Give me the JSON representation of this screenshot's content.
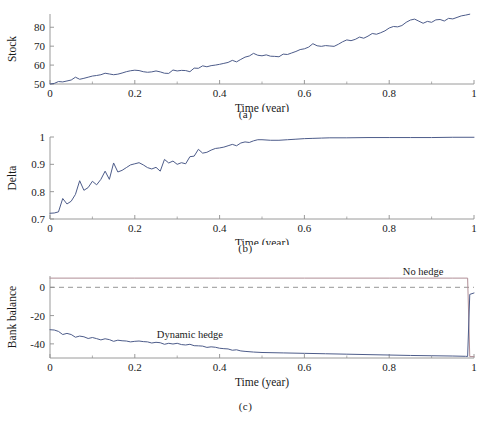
{
  "figure": {
    "panels": [
      {
        "id": "a",
        "caption": "(a)",
        "ylabel": "Stock",
        "xlabel": "Time (year)"
      },
      {
        "id": "b",
        "caption": "(b)",
        "ylabel": "Delta",
        "xlabel": "Time (year)"
      },
      {
        "id": "c",
        "caption": "(c)",
        "ylabel": "Bank balance",
        "xlabel": "Time (year)"
      }
    ]
  },
  "colors": {
    "line_primary": "#4d5c8a",
    "line_nohedge": "#b08d95",
    "zero_dashed": "#8a8a8a",
    "axis": "#8f8f8f",
    "text": "#1a1a1a",
    "background": "#ffffff"
  },
  "chart_data": [
    {
      "type": "line",
      "panel": "a",
      "title": "",
      "xlabel": "Time (year)",
      "ylabel": "Stock",
      "xlim": [
        0,
        1
      ],
      "ylim": [
        50,
        87
      ],
      "xticks": [
        0,
        0.2,
        0.4,
        0.6,
        0.8,
        1
      ],
      "xticklabels": [
        "0",
        "0.2",
        "0.4",
        "0.6",
        "0.8",
        "1"
      ],
      "yticks": [
        50,
        60,
        70,
        80
      ],
      "yticklabels": [
        "50",
        "60",
        "70",
        "80"
      ],
      "grid": false,
      "legend": "none",
      "series": [
        {
          "name": "Stock price path",
          "color": "#4d5c8a",
          "x": [
            0,
            0.01,
            0.02,
            0.03,
            0.04,
            0.05,
            0.06,
            0.07,
            0.08,
            0.09,
            0.1,
            0.11,
            0.12,
            0.13,
            0.14,
            0.15,
            0.16,
            0.17,
            0.18,
            0.19,
            0.2,
            0.21,
            0.22,
            0.23,
            0.24,
            0.25,
            0.26,
            0.27,
            0.28,
            0.29,
            0.3,
            0.31,
            0.32,
            0.33,
            0.34,
            0.35,
            0.36,
            0.37,
            0.38,
            0.39,
            0.4,
            0.41,
            0.42,
            0.43,
            0.44,
            0.45,
            0.46,
            0.47,
            0.48,
            0.49,
            0.5,
            0.51,
            0.52,
            0.53,
            0.54,
            0.55,
            0.56,
            0.57,
            0.58,
            0.59,
            0.6,
            0.61,
            0.62,
            0.63,
            0.64,
            0.65,
            0.66,
            0.67,
            0.68,
            0.69,
            0.7,
            0.71,
            0.72,
            0.73,
            0.74,
            0.75,
            0.76,
            0.77,
            0.78,
            0.79,
            0.8,
            0.81,
            0.82,
            0.83,
            0.84,
            0.85,
            0.86,
            0.87,
            0.88,
            0.89,
            0.9,
            0.91,
            0.92,
            0.93,
            0.94,
            0.95,
            0.96,
            0.97,
            0.98,
            0.99,
            1
          ],
          "y": [
            50,
            50.3,
            51.3,
            51.1,
            51.6,
            52.1,
            53.6,
            52.5,
            53,
            53.6,
            54.2,
            54.5,
            54.9,
            55.7,
            55.3,
            54.9,
            55.2,
            55.8,
            56.5,
            57,
            57.3,
            57.1,
            56.5,
            56.2,
            56.4,
            56.9,
            56.4,
            55.7,
            55.6,
            57.4,
            56.9,
            57.2,
            57.1,
            56.5,
            58.4,
            58.3,
            59.6,
            59.1,
            59.7,
            60,
            60.4,
            60.9,
            61.4,
            62.5,
            61.7,
            63,
            64.2,
            64.8,
            66.2,
            65.2,
            64.9,
            65.4,
            64.7,
            64.6,
            64.4,
            65.8,
            65.6,
            66.4,
            67.2,
            68.2,
            68.6,
            69.5,
            71.3,
            70.2,
            69.9,
            70.3,
            70.1,
            69.9,
            71,
            72.3,
            73.3,
            72.9,
            73.6,
            74.8,
            74.2,
            75.3,
            76.7,
            76.3,
            77.1,
            78.1,
            79.6,
            80.4,
            80.2,
            80.9,
            82.6,
            83.8,
            84.3,
            83.2,
            82.1,
            83.1,
            82.6,
            83.9,
            84.1,
            83.3,
            84.7,
            84.4,
            85.2,
            86,
            86.4,
            86.9
          ]
        }
      ]
    },
    {
      "type": "line",
      "panel": "b",
      "title": "",
      "xlabel": "Time (year)",
      "ylabel": "Delta",
      "xlim": [
        0,
        1
      ],
      "ylim": [
        0.7,
        1.0
      ],
      "xticks": [
        0,
        0.2,
        0.4,
        0.6,
        0.8,
        1
      ],
      "xticklabels": [
        "0",
        "0.2",
        "0.4",
        "0.6",
        "0.8",
        "1"
      ],
      "yticks": [
        0.7,
        0.8,
        0.9,
        1
      ],
      "yticklabels": [
        "0.7",
        "0.8",
        "0.9",
        "1"
      ],
      "grid": false,
      "legend": "none",
      "series": [
        {
          "name": "Delta of option",
          "color": "#4d5c8a",
          "x": [
            0,
            0.01,
            0.02,
            0.03,
            0.04,
            0.05,
            0.06,
            0.07,
            0.08,
            0.09,
            0.1,
            0.11,
            0.12,
            0.13,
            0.14,
            0.15,
            0.16,
            0.17,
            0.18,
            0.19,
            0.2,
            0.21,
            0.22,
            0.23,
            0.24,
            0.25,
            0.26,
            0.27,
            0.28,
            0.29,
            0.3,
            0.31,
            0.32,
            0.33,
            0.34,
            0.35,
            0.36,
            0.37,
            0.38,
            0.39,
            0.4,
            0.41,
            0.42,
            0.43,
            0.44,
            0.45,
            0.46,
            0.47,
            0.48,
            0.49,
            0.5,
            0.52,
            0.54,
            0.56,
            0.58,
            0.6,
            0.62,
            0.64,
            0.66,
            0.7,
            0.75,
            0.8,
            0.85,
            0.9,
            0.95,
            1
          ],
          "y": [
            0.721,
            0.722,
            0.726,
            0.775,
            0.755,
            0.765,
            0.79,
            0.84,
            0.805,
            0.815,
            0.838,
            0.825,
            0.845,
            0.875,
            0.845,
            0.905,
            0.872,
            0.878,
            0.888,
            0.898,
            0.902,
            0.906,
            0.898,
            0.888,
            0.883,
            0.889,
            0.875,
            0.918,
            0.905,
            0.912,
            0.9,
            0.906,
            0.902,
            0.928,
            0.93,
            0.955,
            0.941,
            0.944,
            0.952,
            0.958,
            0.96,
            0.963,
            0.968,
            0.973,
            0.968,
            0.978,
            0.982,
            0.98,
            0.986,
            0.99,
            0.99,
            0.988,
            0.988,
            0.99,
            0.992,
            0.994,
            0.995,
            0.996,
            0.997,
            0.997,
            0.998,
            0.998,
            0.998,
            0.998,
            0.999,
            0.999
          ]
        }
      ]
    },
    {
      "type": "line",
      "panel": "c",
      "title": "",
      "xlabel": "Time (year)",
      "ylabel": "Bank balance",
      "xlim": [
        0,
        1
      ],
      "ylim": [
        -50,
        8
      ],
      "xticks": [
        0,
        0.2,
        0.4,
        0.6,
        0.8,
        1
      ],
      "xticklabels": [
        "0",
        "0.2",
        "0.4",
        "0.6",
        "0.8",
        "1"
      ],
      "yticks": [
        0,
        -20,
        -40
      ],
      "yticklabels": [
        "0",
        "-20",
        "-40"
      ],
      "grid": false,
      "legend": "annotations",
      "annotations": [
        {
          "text": "No hedge",
          "x": 0.88,
          "y": 8.5
        },
        {
          "text": "Dynamic hedge",
          "x": 0.33,
          "y": -36
        }
      ],
      "reference_lines": [
        {
          "name": "zero-line",
          "y": 0,
          "style": "dashed",
          "color": "#8a8a8a"
        }
      ],
      "series": [
        {
          "name": "No hedge",
          "color": "#b08d95",
          "x": [
            0,
            0.2,
            0.4,
            0.6,
            0.8,
            0.95,
            0.985,
            0.99,
            1
          ],
          "y": [
            6.5,
            6.5,
            6.5,
            6.5,
            6.5,
            6.5,
            6.5,
            -49,
            -49
          ]
        },
        {
          "name": "Dynamic hedge",
          "color": "#4d5c8a",
          "x": [
            0,
            0.01,
            0.02,
            0.03,
            0.04,
            0.05,
            0.06,
            0.07,
            0.08,
            0.09,
            0.1,
            0.11,
            0.12,
            0.13,
            0.14,
            0.15,
            0.16,
            0.17,
            0.18,
            0.19,
            0.2,
            0.21,
            0.22,
            0.23,
            0.24,
            0.25,
            0.26,
            0.27,
            0.28,
            0.29,
            0.3,
            0.31,
            0.32,
            0.33,
            0.34,
            0.35,
            0.36,
            0.37,
            0.38,
            0.39,
            0.4,
            0.41,
            0.42,
            0.43,
            0.44,
            0.45,
            0.46,
            0.48,
            0.5,
            0.55,
            0.6,
            0.65,
            0.7,
            0.75,
            0.8,
            0.85,
            0.9,
            0.95,
            0.98,
            0.985,
            0.99,
            1
          ],
          "y": [
            -30,
            -30.2,
            -31.2,
            -33.4,
            -32.6,
            -33.4,
            -35.3,
            -34.5,
            -35,
            -36.2,
            -35.5,
            -36.3,
            -37.2,
            -36.4,
            -37,
            -38.2,
            -37.4,
            -37.8,
            -38,
            -38.6,
            -38.2,
            -38,
            -38.4,
            -38.6,
            -39.4,
            -38.9,
            -39.2,
            -40.3,
            -39.6,
            -40.1,
            -39.6,
            -40.5,
            -40.8,
            -40.3,
            -41.3,
            -41.4,
            -41.6,
            -42.5,
            -42.1,
            -42.4,
            -43.1,
            -43.4,
            -43.6,
            -44.5,
            -44.2,
            -45,
            -45.3,
            -45.8,
            -46.1,
            -46.4,
            -46.7,
            -47,
            -47.3,
            -47.6,
            -47.9,
            -48.2,
            -48.4,
            -48.6,
            -48.8,
            -48.9,
            -5,
            -4
          ]
        }
      ]
    }
  ]
}
